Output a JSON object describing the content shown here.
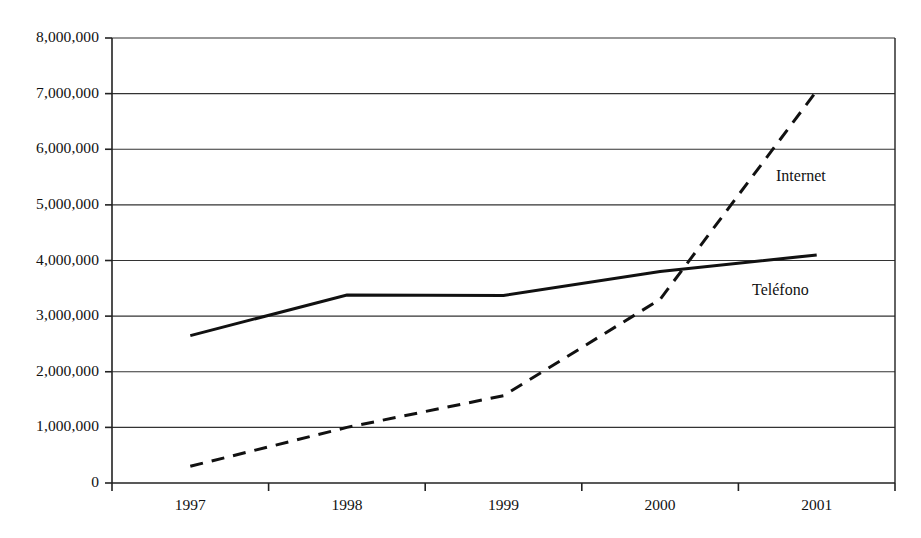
{
  "chart_data": {
    "type": "line",
    "title": "",
    "subtitle": "",
    "xlabel": "",
    "ylabel": "",
    "categories": [
      "1997",
      "1998",
      "1999",
      "2000",
      "2001"
    ],
    "x": [
      1997,
      1998,
      1999,
      2000,
      2001
    ],
    "ylim": [
      0,
      8000000
    ],
    "ytick_values": [
      0,
      1000000,
      2000000,
      3000000,
      4000000,
      5000000,
      6000000,
      7000000,
      8000000
    ],
    "ytick_labels": [
      "0",
      "1,000,000",
      "2,000,000",
      "3,000,000",
      "4,000,000",
      "5,000,000",
      "6,000,000",
      "7,000,000",
      "8,000,000"
    ],
    "grid": true,
    "grid_axis": "y",
    "legend_position": "inline-annotation",
    "series": [
      {
        "name": "Teléfono",
        "style": "solid",
        "color": "#111111",
        "width": 3.0,
        "values": [
          2650000,
          3380000,
          3370000,
          3800000,
          4100000
        ],
        "annotation": {
          "label": "Teléfono",
          "x_px": 752,
          "y_px": 281
        }
      },
      {
        "name": "Internet",
        "style": "dashed",
        "color": "#111111",
        "width": 3.0,
        "values": [
          300000,
          1000000,
          1570000,
          3300000,
          7050000
        ],
        "annotation": {
          "label": "Internet",
          "x_px": 776,
          "y_px": 167
        }
      }
    ],
    "annotations": [
      "Internet",
      "Teléfono"
    ],
    "axis": {
      "color": "#222222",
      "plot_left_px": 112,
      "plot_right_px": 895,
      "plot_top_px": 38,
      "plot_bottom_px": 483
    }
  }
}
